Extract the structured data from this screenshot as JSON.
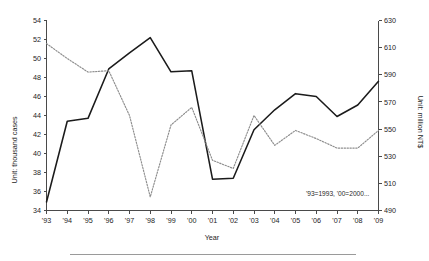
{
  "figure": {
    "background": "#ffffff",
    "footer_rule": true
  },
  "chart_data": {
    "type": "line",
    "title": "",
    "xlabel": "Year",
    "grid": false,
    "legend": false,
    "annotation": "'93=1993, '00=2000...",
    "categories": [
      "'93",
      "'94",
      "'95",
      "'96",
      "'97",
      "'98",
      "'99",
      "'00",
      "'01",
      "'02",
      "'03",
      "'04",
      "'05",
      "'06",
      "'07",
      "'08",
      "'09"
    ],
    "x": [
      1993,
      1994,
      1995,
      1996,
      1997,
      1998,
      1999,
      2000,
      2001,
      2002,
      2003,
      2004,
      2005,
      2006,
      2007,
      2008,
      2009
    ],
    "axes": {
      "left": {
        "label": "Unit: thousand cases",
        "ylim": [
          34,
          54
        ],
        "ticks": [
          34,
          36,
          38,
          40,
          42,
          44,
          46,
          48,
          50,
          52,
          54
        ],
        "tick_labels": [
          "34",
          "36",
          "38",
          "40",
          "42",
          "44",
          "46",
          "48",
          "50",
          "52",
          "54"
        ]
      },
      "right": {
        "label": "Unit: million NT$",
        "ylim": [
          490,
          630
        ],
        "ticks": [
          490,
          510,
          530,
          550,
          570,
          590,
          610,
          630
        ],
        "tick_labels": [
          "490",
          "510",
          "530",
          "550",
          "570",
          "590",
          "610",
          "630"
        ]
      }
    },
    "series": [
      {
        "name": "cases",
        "style": "solid",
        "color": "#1b1b1b",
        "axis": "left",
        "values": [
          34.9,
          43.4,
          43.7,
          48.9,
          50.6,
          52.2,
          48.6,
          48.7,
          37.3,
          37.4,
          42.5,
          44.6,
          46.3,
          46.0,
          43.9,
          45.1,
          47.6
        ]
      },
      {
        "name": "amount",
        "style": "dotted",
        "color": "#8d8d8d",
        "axis": "right",
        "values": [
          613,
          602,
          592,
          593,
          560,
          500,
          553,
          566,
          527,
          521,
          560,
          538,
          549,
          543,
          536,
          536,
          549
        ]
      }
    ]
  }
}
